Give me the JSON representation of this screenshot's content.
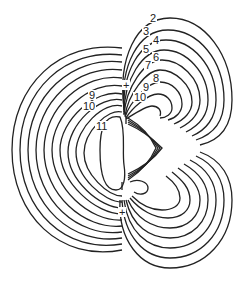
{
  "figure": {
    "type": "contour-plot",
    "labels": {
      "upper_right": [
        "2",
        "3",
        "4",
        "5",
        "6",
        "7",
        "8",
        "9",
        "10"
      ],
      "left": [
        "9",
        "10",
        "11"
      ]
    },
    "markers": [
      "+",
      "+"
    ]
  },
  "labels": {
    "l2": "2",
    "l3": "3",
    "l4": "4",
    "l5": "5",
    "l6": "6",
    "l7": "7",
    "l8": "8",
    "l9r": "9",
    "l10r": "10",
    "l9": "9",
    "l10": "10",
    "l11": "11",
    "plus1": "+",
    "plus2": "+"
  }
}
